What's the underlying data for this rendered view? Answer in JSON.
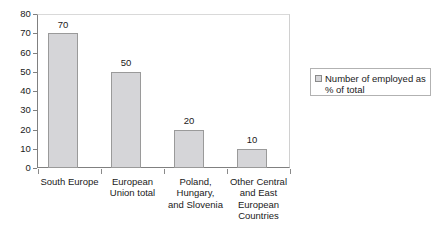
{
  "chart_data": {
    "type": "bar",
    "title": "",
    "subtitle": "",
    "xlabel": "",
    "ylabel": "",
    "ylim": [
      0,
      80
    ],
    "y_ticks": [
      0,
      10,
      20,
      30,
      40,
      50,
      60,
      70,
      80
    ],
    "grid": false,
    "legend_position": "right",
    "categories": [
      "South Europe",
      "European Union total",
      "Poland, Hungary, and Slovenia",
      "Other Central and East European Countries"
    ],
    "category_lines": [
      [
        "South Europe"
      ],
      [
        "European",
        "Union total"
      ],
      [
        "Poland,",
        "Hungary,",
        "and Slovenia"
      ],
      [
        "Other Central",
        "and East",
        "European",
        "Countries"
      ]
    ],
    "series": [
      {
        "name": "Number of employed as % of total",
        "values": [
          70,
          50,
          20,
          10
        ],
        "color": "#d5d5d8",
        "border_color": "#9a9a9a"
      }
    ],
    "value_labels": [
      "70",
      "50",
      "20",
      "10"
    ]
  },
  "legend": {
    "entries": [
      {
        "label_lines": [
          "Number of employed",
          "as % of total"
        ],
        "label": "Number of employed as % of total",
        "swatch_color": "#d5d5d8"
      }
    ]
  },
  "axis": {
    "y_tick_labels": [
      "80",
      "70",
      "60",
      "50",
      "40",
      "30",
      "20",
      "10",
      "0"
    ]
  }
}
